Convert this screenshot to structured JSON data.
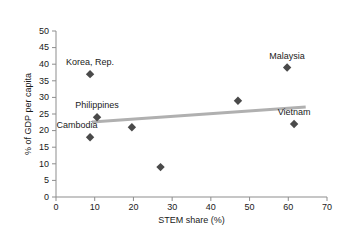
{
  "chart_data": {
    "type": "scatter",
    "title": "",
    "xlabel": "STEM share (%)",
    "ylabel": "% of GDP per capita",
    "xlim": [
      0,
      70
    ],
    "ylim": [
      0,
      50
    ],
    "xticks": [
      0,
      10,
      20,
      30,
      40,
      50,
      60,
      70
    ],
    "yticks": [
      0,
      5,
      10,
      15,
      20,
      25,
      30,
      35,
      40,
      45,
      50
    ],
    "grid": false,
    "legend": "none",
    "marker_shape": "diamond",
    "marker_color": "#4a4a4a",
    "trendline_color": "#b0b0b0",
    "points": [
      {
        "label": "Cambodia",
        "x": 8.8,
        "y": 18.0,
        "label_dx": -13,
        "label_dy": -9
      },
      {
        "label": "Korea, Rep.",
        "x": 8.8,
        "y": 37.0,
        "label_dx": 0,
        "label_dy": -9
      },
      {
        "label": "Philippines",
        "x": 10.6,
        "y": 24.0,
        "label_dx": 0,
        "label_dy": -9
      },
      {
        "label": "",
        "x": 19.6,
        "y": 21.0,
        "label_dx": 0,
        "label_dy": -9
      },
      {
        "label": "",
        "x": 27.0,
        "y": 9.0,
        "label_dx": 0,
        "label_dy": -9
      },
      {
        "label": "",
        "x": 47.0,
        "y": 29.0,
        "label_dx": 0,
        "label_dy": -9
      },
      {
        "label": "Malaysia",
        "x": 59.7,
        "y": 39.0,
        "label_dx": 0,
        "label_dy": -9
      },
      {
        "label": "Vietnam",
        "x": 61.5,
        "y": 22.0,
        "label_dx": 0,
        "label_dy": -9
      }
    ],
    "trendline": {
      "x0": 9.3,
      "y0": 22.6,
      "x1": 64.5,
      "y1": 27.1
    }
  }
}
